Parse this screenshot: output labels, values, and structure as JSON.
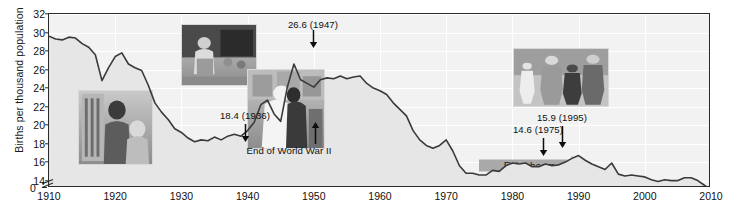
{
  "chart_data": {
    "type": "line",
    "title": "",
    "xlabel": "",
    "ylabel": "Births per thousand population",
    "xlim": [
      1910,
      2010
    ],
    "ylim": [
      13.2,
      32
    ],
    "y_axis_break": true,
    "y_break_label": "0",
    "grid": true,
    "legend": "none",
    "xticks": [
      1910,
      1920,
      1930,
      1940,
      1950,
      1960,
      1970,
      1980,
      1990,
      2000,
      2010
    ],
    "yticks": [
      14,
      16,
      18,
      20,
      22,
      24,
      26,
      28,
      30,
      32
    ],
    "series": [
      {
        "name": "US birth rate",
        "x": [
          1910,
          1911,
          1912,
          1913,
          1914,
          1915,
          1916,
          1917,
          1918,
          1919,
          1920,
          1921,
          1922,
          1923,
          1924,
          1925,
          1926,
          1927,
          1928,
          1929,
          1930,
          1931,
          1932,
          1933,
          1934,
          1935,
          1936,
          1937,
          1938,
          1939,
          1940,
          1941,
          1942,
          1943,
          1944,
          1945,
          1946,
          1947,
          1948,
          1949,
          1950,
          1951,
          1952,
          1953,
          1954,
          1955,
          1956,
          1957,
          1958,
          1959,
          1960,
          1961,
          1962,
          1963,
          1964,
          1965,
          1966,
          1967,
          1968,
          1969,
          1970,
          1971,
          1972,
          1973,
          1974,
          1975,
          1976,
          1977,
          1978,
          1979,
          1980,
          1981,
          1982,
          1983,
          1984,
          1985,
          1986,
          1987,
          1988,
          1989,
          1990,
          1991,
          1992,
          1993,
          1994,
          1995,
          1996,
          1997,
          1998,
          1999,
          2000,
          2001,
          2002,
          2003,
          2004,
          2005,
          2006,
          2007,
          2008,
          2009,
          2010
        ],
        "values": [
          29.6,
          29.3,
          29.2,
          29.5,
          29.4,
          28.8,
          28.4,
          27.6,
          24.8,
          26.2,
          27.4,
          27.8,
          26.6,
          26.2,
          25.9,
          24.3,
          22.4,
          21.4,
          20.6,
          19.6,
          19.2,
          18.6,
          18.2,
          18.4,
          18.3,
          18.7,
          18.4,
          18.8,
          19.0,
          18.8,
          19.4,
          20.3,
          22.2,
          22.7,
          21.2,
          20.4,
          24.1,
          26.6,
          24.9,
          24.5,
          24.1,
          24.9,
          25.1,
          25.0,
          25.3,
          25.0,
          25.2,
          25.3,
          24.5,
          24.0,
          23.7,
          23.3,
          22.4,
          21.7,
          21.0,
          19.4,
          18.4,
          17.8,
          17.5,
          17.8,
          18.4,
          17.2,
          15.6,
          14.8,
          14.8,
          14.6,
          14.6,
          15.1,
          15.0,
          15.6,
          15.9,
          15.8,
          15.9,
          15.5,
          15.5,
          15.8,
          15.6,
          15.7,
          16.0,
          16.4,
          16.7,
          16.2,
          15.8,
          15.5,
          15.2,
          15.9,
          14.7,
          14.5,
          14.6,
          14.5,
          14.4,
          14.1,
          13.9,
          14.1,
          14.0,
          14.0,
          14.3,
          14.3,
          14.0,
          13.5,
          13.0
        ]
      }
    ],
    "annotations": [
      {
        "label": "18.4 (1936)",
        "x": 1936,
        "y": 18.4,
        "direction": "down"
      },
      {
        "label": "26.6 (1947)",
        "x": 1947,
        "y": 26.6,
        "direction": "down"
      },
      {
        "label": "End of World War II",
        "x": 1945,
        "y": 20.4,
        "direction": "up"
      },
      {
        "label": "14.6 (1975)",
        "x": 1975,
        "y": 14.6,
        "direction": "down"
      },
      {
        "label": "15.9 (1995)",
        "x": 1995,
        "y": 15.9,
        "direction": "down"
      }
    ],
    "era_bands": [
      {
        "label": "Demographic transition",
        "start": 1910,
        "end": 1930
      },
      {
        "label": "Depression",
        "start": 1930,
        "end": 1941
      },
      {
        "label": "Baby boom",
        "start": 1945,
        "end": 1964
      },
      {
        "label": "Echo boom",
        "start": 1975,
        "end": 1992
      }
    ],
    "photos": [
      {
        "name": "textile-mill-worker-photo",
        "era": "Demographic transition"
      },
      {
        "name": "depression-family-photo",
        "era": "Depression"
      },
      {
        "name": "vj-day-kiss-photo",
        "era": "End of World War II"
      },
      {
        "name": "family-walking-photo",
        "era": "Echo boom"
      }
    ],
    "colors": {
      "line": "#3a3a3a",
      "plot_background": "#f2f2f2",
      "gridline": "#ffffff",
      "band_light": "#cfcfcf",
      "band_dark": "#a6a6a6",
      "axis": "#2a2a2a",
      "text": "#111111"
    }
  }
}
